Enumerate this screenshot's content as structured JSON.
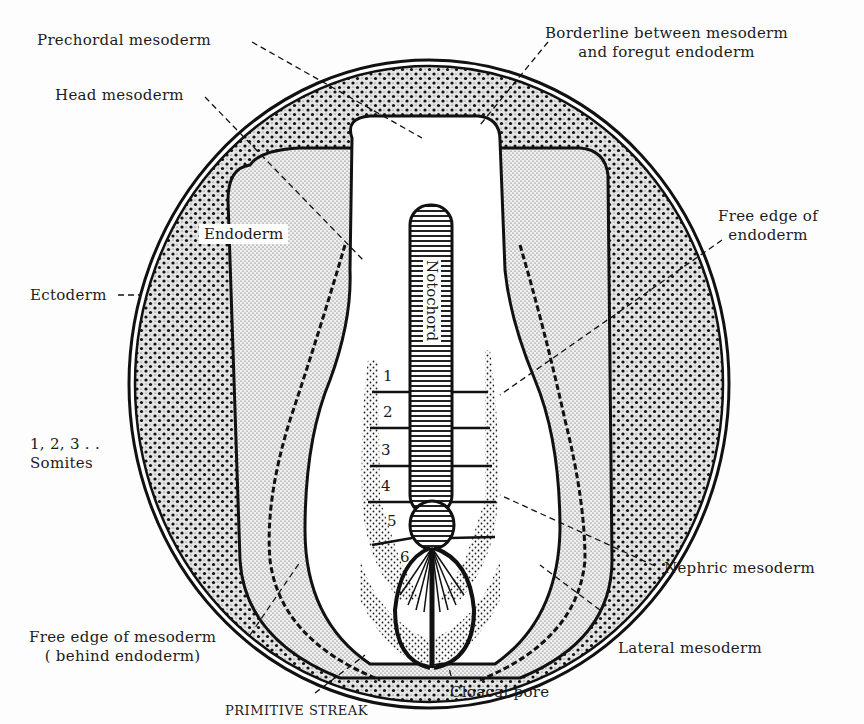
{
  "diagram": {
    "labels": {
      "prechordal": "Prechordal mesoderm",
      "borderline_1": "Borderline between mesoderm",
      "borderline_2": "and foregut endoderm",
      "head": "Head mesoderm",
      "endoderm": "Endoderm",
      "free_edge_endo_1": "Free edge of",
      "free_edge_endo_2": "endoderm",
      "ectoderm": "Ectoderm",
      "notochord": "Notochord",
      "somites_1": "1, 2, 3 . .",
      "somites_2": "Somites",
      "nephric": "Nephric mesoderm",
      "free_edge_meso_1": "Free edge of mesoderm",
      "free_edge_meso_2": "( behind endoderm)",
      "lateral": "Lateral mesoderm",
      "cloacal": "Cloacal pore",
      "primitive_streak": "PRIMITIVE STREAK"
    },
    "somite_numbers": [
      "1",
      "2",
      "3",
      "4",
      "5",
      "6"
    ],
    "colors": {
      "ink": "#1a1a1a",
      "paper": "#fdfdfd"
    }
  }
}
